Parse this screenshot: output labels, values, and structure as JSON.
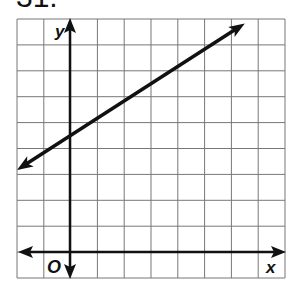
{
  "problem_number": "31.",
  "chart_data": {
    "type": "line",
    "title": "",
    "xlabel": "x",
    "ylabel": "y",
    "origin_label": "O",
    "xlim": [
      -2,
      8
    ],
    "ylim": [
      -1,
      9
    ],
    "grid": true,
    "series": [
      {
        "name": "line",
        "slope": 0.6667,
        "y_intercept": 4.5,
        "x": [
          -2,
          6.5
        ],
        "y": [
          3.17,
          8.83
        ],
        "arrows": "both"
      }
    ]
  }
}
